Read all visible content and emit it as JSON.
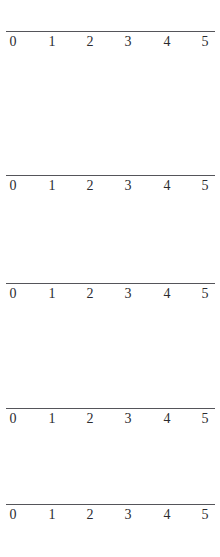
{
  "page": {
    "background_color": "#ffffff",
    "width": 220,
    "height": 557
  },
  "style": {
    "line_color": "#55555a",
    "label_color": "#2b2b30",
    "line_thickness_px": 1
  },
  "number_lines": [
    {
      "id": "number-line-1",
      "axis_y": 31,
      "line_start_x": 6,
      "line_end_x": 215,
      "labels": [
        "0",
        "1",
        "2",
        "3",
        "4",
        "5"
      ],
      "label_x": [
        13,
        52,
        90,
        128,
        167,
        205
      ],
      "label_y": 33,
      "min": 0,
      "max": 5,
      "tick_marks_visible": false
    },
    {
      "id": "number-line-2",
      "axis_y": 175,
      "line_start_x": 6,
      "line_end_x": 215,
      "labels": [
        "0",
        "1",
        "2",
        "3",
        "4",
        "5"
      ],
      "label_x": [
        13,
        52,
        90,
        128,
        167,
        205
      ],
      "label_y": 177,
      "min": 0,
      "max": 5,
      "tick_marks_visible": false
    },
    {
      "id": "number-line-3",
      "axis_y": 283,
      "line_start_x": 6,
      "line_end_x": 215,
      "labels": [
        "0",
        "1",
        "2",
        "3",
        "4",
        "5"
      ],
      "label_x": [
        13,
        52,
        90,
        128,
        167,
        205
      ],
      "label_y": 285,
      "min": 0,
      "max": 5,
      "tick_marks_visible": false
    },
    {
      "id": "number-line-4",
      "axis_y": 408,
      "line_start_x": 6,
      "line_end_x": 215,
      "labels": [
        "0",
        "1",
        "2",
        "3",
        "4",
        "5"
      ],
      "label_x": [
        13,
        52,
        90,
        128,
        167,
        205
      ],
      "label_y": 410,
      "min": 0,
      "max": 5,
      "tick_marks_visible": false
    },
    {
      "id": "number-line-5",
      "axis_y": 504,
      "line_start_x": 6,
      "line_end_x": 215,
      "labels": [
        "0",
        "1",
        "2",
        "3",
        "4",
        "5"
      ],
      "label_x": [
        13,
        52,
        90,
        128,
        167,
        205
      ],
      "label_y": 506,
      "min": 0,
      "max": 5,
      "tick_marks_visible": false
    }
  ]
}
